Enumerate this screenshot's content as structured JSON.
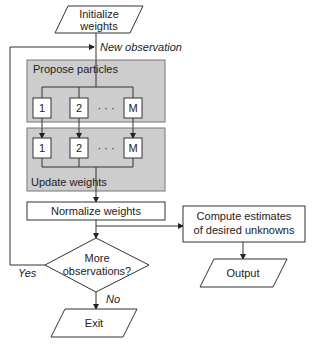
{
  "diagram": {
    "type": "flowchart",
    "nodes": {
      "initialize": {
        "shape": "parallelogram",
        "line1": "Initialize",
        "line2": "weights"
      },
      "propose": {
        "shape": "group",
        "label": "Propose particles",
        "particles": [
          "1",
          "2",
          "· · ·",
          "M"
        ]
      },
      "update": {
        "shape": "group",
        "label": "Update weights",
        "particles": [
          "1",
          "2",
          "· · ·",
          "M"
        ]
      },
      "normalize": {
        "shape": "rectangle",
        "label": "Normalize weights"
      },
      "decision": {
        "shape": "diamond",
        "line1": "More",
        "line2": "observations?"
      },
      "compute": {
        "shape": "rectangle",
        "line1": "Compute estimates",
        "line2": "of desired unknowns"
      },
      "output": {
        "shape": "parallelogram",
        "label": "Output"
      },
      "exit": {
        "shape": "parallelogram",
        "label": "Exit"
      }
    },
    "edge_labels": {
      "new_observation": "New observation",
      "yes": "Yes",
      "no": "No"
    },
    "colors": {
      "group_fill": "#cdcdcd",
      "group_border": "#777777",
      "line": "#333333",
      "box_fill": "#ffffff"
    }
  }
}
